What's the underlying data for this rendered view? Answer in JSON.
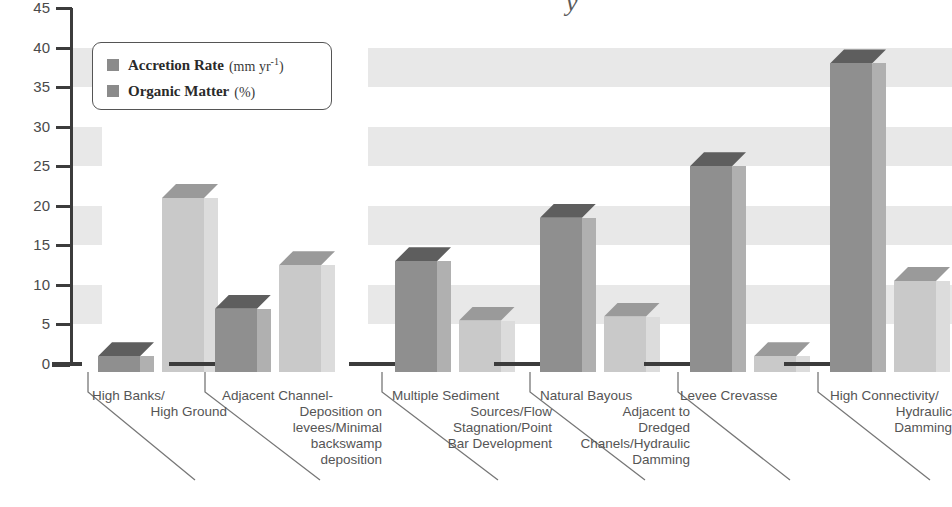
{
  "chart_data": {
    "type": "bar",
    "title": "",
    "xlabel": "",
    "ylabel": "",
    "ylim": [
      0,
      45
    ],
    "yticks": [
      0,
      5,
      10,
      15,
      20,
      25,
      30,
      35,
      40,
      45
    ],
    "grid": "alternating horizontal bands",
    "legend_position": "top-left inside plot",
    "categories": [
      "High Banks/\nHigh Ground",
      "Adjacent Channel-\nDeposition on\nlevees/Minimal\nbackswamp\ndeposition",
      "Multiple Sediment\nSources/Flow\nStagnation/Point\nBar Development",
      "Natural Bayous\nAdjacent to\nDredged\nChanels/Hydraulic\nDamming",
      "Levee Crevasse",
      "High Connectivity/\nHydraulic\nDamming"
    ],
    "series": [
      {
        "name": "Accretion Rate",
        "unit": "mm yr-1",
        "values": [
          2,
          8,
          14,
          19.5,
          26,
          39
        ]
      },
      {
        "name": "Organic Matter",
        "unit": "%",
        "values": [
          22,
          13.5,
          6.5,
          7,
          2,
          11.5
        ]
      }
    ]
  },
  "legend": {
    "items": [
      {
        "name": "Accretion Rate",
        "unit_open": "(mm yr",
        "unit_sup": "-1",
        "unit_close": ")"
      },
      {
        "name": "Organic Matter",
        "unit_open": "(",
        "unit_sup": "",
        "unit_close": "%)"
      }
    ]
  },
  "axis": {
    "y_tick_labels": [
      "45",
      "40",
      "35",
      "30",
      "25",
      "20",
      "15",
      "10",
      "5",
      "0"
    ]
  },
  "categories_lines": [
    [
      "High Banks/",
      "High Ground"
    ],
    [
      "Adjacent Channel-",
      "Deposition on",
      "levees/Minimal",
      "backswamp",
      "deposition"
    ],
    [
      "Multiple Sediment",
      "Sources/Flow",
      "Stagnation/Point",
      "Bar Development"
    ],
    [
      "Natural Bayous",
      "Adjacent to",
      "Dredged",
      "Chanels/Hydraulic",
      "Damming"
    ],
    [
      "Levee Crevasse"
    ],
    [
      "High Connectivity/",
      "Hydraulic",
      "Damming"
    ]
  ],
  "title_fragment": "y",
  "colors": {
    "accretion_front": "#8f8f8f",
    "accretion_side": "#b0b0b0",
    "accretion_top": "#5e5e5e",
    "organic_front": "#c9c9c9",
    "organic_side": "#dcdcdc",
    "organic_top": "#9a9a9a",
    "band": "#e8e8e8",
    "axis": "#3c3c3c",
    "text": "#4a4a4a"
  }
}
